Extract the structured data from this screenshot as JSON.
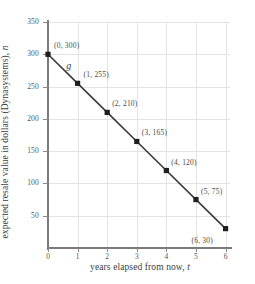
{
  "chart_data": {
    "type": "line",
    "title": "",
    "xlabel": "years elapsed from now, t",
    "xlabel_text": "years elapsed from now, ",
    "xlabel_var": "t",
    "ylabel": "expected resale value in dollars (Dynasystems), n",
    "ylabel_text": "expected resale value in dollars (Dynasystems), ",
    "ylabel_var": "n",
    "series_name": "g",
    "x": [
      0,
      1,
      2,
      3,
      4,
      5,
      6
    ],
    "values": [
      300,
      255,
      210,
      165,
      120,
      75,
      30
    ],
    "point_labels": [
      "(0, 300)",
      "(1, 255)",
      "(2, 210)",
      "(3, 165)",
      "(4, 120)",
      "(5, 75)",
      "(6, 30)"
    ],
    "xlim": [
      0,
      6.15
    ],
    "ylim": [
      0,
      350
    ],
    "xticks": [
      0,
      1,
      2,
      3,
      4,
      5,
      6
    ],
    "xtick_labels": [
      "0",
      "1",
      "2",
      "3",
      "4",
      "5",
      "6"
    ],
    "yticks": [
      50,
      100,
      150,
      200,
      250,
      300,
      350
    ],
    "ytick_labels": [
      "50",
      "100",
      "150",
      "200",
      "250",
      "300",
      "350"
    ],
    "grid": true,
    "legend_position": "none",
    "colors": {
      "line": "#3a3a3a",
      "marker": "#1e1e1e",
      "grid": "#e3e3e3",
      "axis": "#7a7a7a",
      "background": "#ffffff",
      "text": "#4a4a4a"
    }
  }
}
